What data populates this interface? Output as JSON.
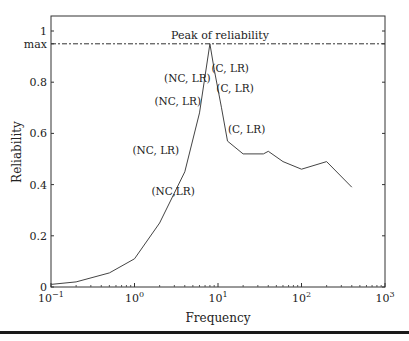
{
  "chart_data": {
    "type": "line",
    "title": "",
    "xlabel": "Frequency",
    "ylabel": "Reliability",
    "xscale": "log",
    "xlim": [
      0.1,
      1000
    ],
    "ylim": [
      0,
      1.05
    ],
    "grid": false,
    "legend": null,
    "x_ticks": [
      {
        "value": 0.1,
        "base": "10",
        "exp": "−1"
      },
      {
        "value": 1,
        "base": "10",
        "exp": "0"
      },
      {
        "value": 10,
        "base": "10",
        "exp": "1"
      },
      {
        "value": 100,
        "base": "10",
        "exp": "2"
      },
      {
        "value": 1000,
        "base": "10",
        "exp": "3"
      }
    ],
    "y_ticks": [
      {
        "value": 0,
        "label": "0"
      },
      {
        "value": 0.2,
        "label": "0.2"
      },
      {
        "value": 0.4,
        "label": "0.4"
      },
      {
        "value": 0.6,
        "label": "0.6"
      },
      {
        "value": 0.8,
        "label": "0.8"
      },
      {
        "value": 0.95,
        "label": "max"
      },
      {
        "value": 1.0,
        "label": "1"
      }
    ],
    "reference_line": {
      "y": 0.95,
      "label": "Peak of reliability",
      "style": "dashed"
    },
    "series": [
      {
        "name": "Reliability",
        "x": [
          0.1,
          0.2,
          0.5,
          1.0,
          2.0,
          4.0,
          6.0,
          8.0,
          9.0,
          11,
          13,
          20,
          35,
          40,
          60,
          100,
          200,
          400
        ],
        "y": [
          0.01,
          0.02,
          0.055,
          0.11,
          0.25,
          0.45,
          0.68,
          0.95,
          0.85,
          0.7,
          0.57,
          0.52,
          0.52,
          0.53,
          0.49,
          0.46,
          0.49,
          0.39
        ]
      }
    ],
    "annotations": [
      {
        "text": "(NC, LR)",
        "x": 4.3,
        "y": 0.8
      },
      {
        "text": "(NC, LR)",
        "x": 3.3,
        "y": 0.71
      },
      {
        "text": "(NC, LR)",
        "x": 1.8,
        "y": 0.52
      },
      {
        "text": "(NC,LR)",
        "x": 2.9,
        "y": 0.36
      },
      {
        "text": "(C, LR)",
        "x": 14,
        "y": 0.84
      },
      {
        "text": "(C, LR)",
        "x": 16,
        "y": 0.76
      },
      {
        "text": "(C, LR)",
        "x": 22,
        "y": 0.6
      }
    ]
  }
}
